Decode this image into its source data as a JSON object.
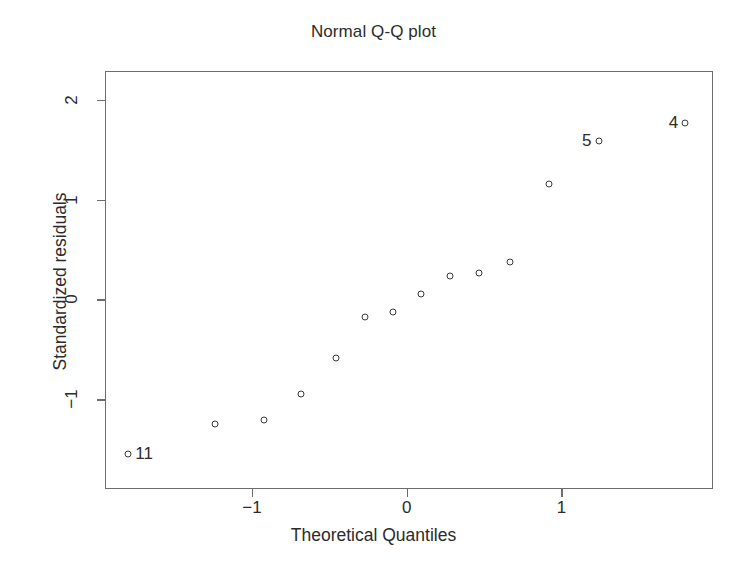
{
  "chart_data": {
    "type": "scatter",
    "title": "Normal Q-Q plot",
    "xlabel": "Theoretical Quantiles",
    "ylabel": "Standardized residuals",
    "xlim": [
      -1.95,
      1.98
    ],
    "ylim": [
      -1.9,
      2.29
    ],
    "grid": false,
    "legend": "none",
    "xticks": [
      -1,
      0,
      1
    ],
    "xticklabels": [
      "−1",
      "0",
      "1"
    ],
    "yticks": [
      -1,
      0,
      1,
      2
    ],
    "yticklabels": [
      "−1",
      "0",
      "1",
      "2"
    ],
    "marker": "open-circle",
    "marker_color": "#3a3a3a",
    "points": [
      {
        "x": -1.8,
        "y": -1.55,
        "label": "11",
        "label_side": "right"
      },
      {
        "x": -1.24,
        "y": -1.25,
        "label": "",
        "label_side": ""
      },
      {
        "x": -0.92,
        "y": -1.21,
        "label": "",
        "label_side": ""
      },
      {
        "x": -0.68,
        "y": -0.95,
        "label": "",
        "label_side": ""
      },
      {
        "x": -0.46,
        "y": -0.59,
        "label": "",
        "label_side": ""
      },
      {
        "x": -0.27,
        "y": -0.18,
        "label": "",
        "label_side": ""
      },
      {
        "x": -0.09,
        "y": -0.13,
        "label": "",
        "label_side": ""
      },
      {
        "x": 0.09,
        "y": 0.05,
        "label": "",
        "label_side": ""
      },
      {
        "x": 0.28,
        "y": 0.24,
        "label": "",
        "label_side": ""
      },
      {
        "x": 0.47,
        "y": 0.27,
        "label": "",
        "label_side": ""
      },
      {
        "x": 0.67,
        "y": 0.38,
        "label": "",
        "label_side": ""
      },
      {
        "x": 0.92,
        "y": 1.16,
        "label": "",
        "label_side": ""
      },
      {
        "x": 1.24,
        "y": 1.59,
        "label": "5",
        "label_side": "left"
      },
      {
        "x": 1.8,
        "y": 1.77,
        "label": "4",
        "label_side": "left"
      }
    ]
  }
}
